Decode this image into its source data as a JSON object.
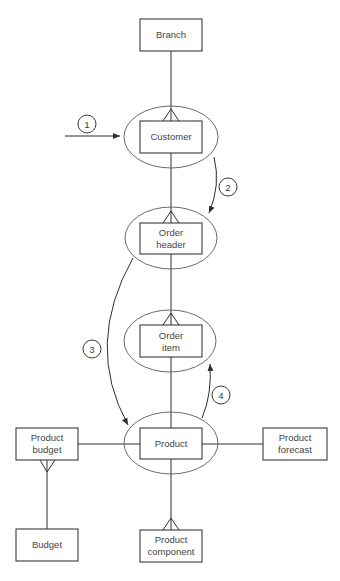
{
  "diagram": {
    "type": "entity-relationship",
    "entities": {
      "branch": {
        "lines": [
          "Branch"
        ]
      },
      "customer": {
        "lines": [
          "Customer"
        ]
      },
      "order_header": {
        "lines": [
          "Order",
          "header"
        ]
      },
      "order_item": {
        "lines": [
          "Order",
          "item"
        ]
      },
      "product": {
        "lines": [
          "Product"
        ]
      },
      "product_budget": {
        "lines": [
          "Product",
          "budget"
        ]
      },
      "budget": {
        "lines": [
          "Budget"
        ]
      },
      "product_forecast": {
        "lines": [
          "Product",
          "forecast"
        ]
      },
      "product_component": {
        "lines": [
          "Product",
          "component"
        ]
      }
    },
    "highlighted_entities": [
      "Customer",
      "Order header",
      "Order item",
      "Product"
    ],
    "relationships": [
      {
        "from": "Branch",
        "to": "Customer",
        "cardinality": "one-to-many"
      },
      {
        "from": "Customer",
        "to": "Order header",
        "cardinality": "one-to-many"
      },
      {
        "from": "Order header",
        "to": "Order item",
        "cardinality": "one-to-many"
      },
      {
        "from": "Order item",
        "to": "Product",
        "cardinality": "many-to-one"
      },
      {
        "from": "Product",
        "to": "Product budget",
        "cardinality": "one-to-one"
      },
      {
        "from": "Product",
        "to": "Product forecast",
        "cardinality": "one-to-one"
      },
      {
        "from": "Product",
        "to": "Product component",
        "cardinality": "one-to-many"
      },
      {
        "from": "Budget",
        "to": "Product budget",
        "cardinality": "one-to-many"
      }
    ],
    "access_path": [
      {
        "step": "1",
        "description": "Entry to Customer"
      },
      {
        "step": "2",
        "description": "Customer to Order header"
      },
      {
        "step": "3",
        "description": "Order header to Product"
      },
      {
        "step": "4",
        "description": "Product to Order item"
      }
    ]
  }
}
